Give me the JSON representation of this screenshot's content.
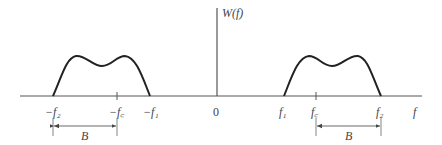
{
  "diagram": {
    "y_axis_label": "W(f)",
    "x_axis_label": "f",
    "origin_label": "0",
    "left_band": {
      "labels": [
        "−f₂",
        "−f꜀",
        "−f₁"
      ],
      "bandwidth_label": "B"
    },
    "right_band": {
      "labels": [
        "f₁",
        "f꜀",
        "f₂"
      ],
      "bandwidth_label": "B"
    },
    "colors": {
      "axis": "#555555",
      "curve": "#222222",
      "text": "#444444"
    }
  }
}
